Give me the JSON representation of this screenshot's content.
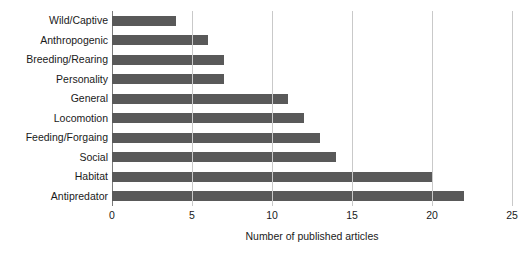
{
  "chart_data": {
    "type": "bar",
    "orientation": "horizontal",
    "title": "",
    "xlabel": "Number of published articles",
    "ylabel": "",
    "categories": [
      "Wild/Captive",
      "Anthropogenic",
      "Breeding/Rearing",
      "Personality",
      "General",
      "Locomotion",
      "Feeding/Forgaing",
      "Social",
      "Habitat",
      "Antipredator"
    ],
    "values": [
      4,
      6,
      7,
      7,
      11,
      12,
      13,
      14,
      20,
      22
    ],
    "xlim": [
      0,
      25
    ],
    "xticks": [
      0,
      5,
      10,
      15,
      20,
      25
    ],
    "xtick_labels": [
      "0",
      "5",
      "10",
      "15",
      "20",
      "25"
    ],
    "grid": "vertical",
    "legend": "none",
    "bar_color": "#595959",
    "gridline_color": "#c9c9c9",
    "axis_color": "#7a7a7a",
    "background_color": "#ffffff"
  }
}
